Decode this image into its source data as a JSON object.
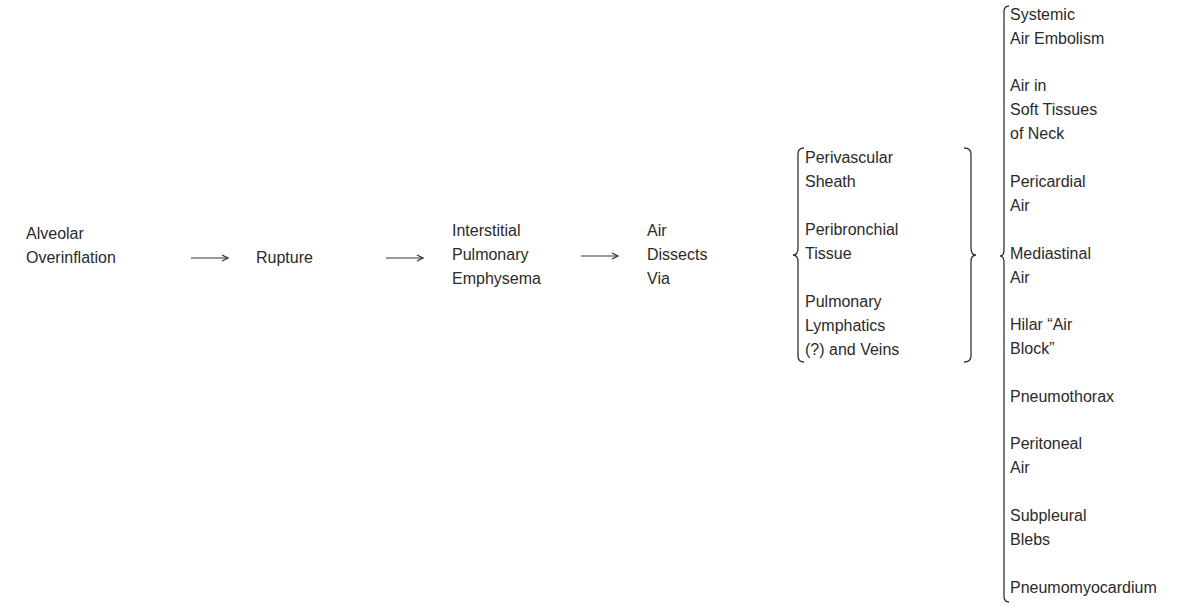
{
  "flow": [
    {
      "id": "alveolar-overinflation",
      "lines": [
        "Alveolar",
        "Overinflation"
      ]
    },
    {
      "id": "rupture",
      "lines": [
        "Rupture"
      ]
    },
    {
      "id": "interstitial-pulmonary-emphysema",
      "lines": [
        "Interstitial",
        "Pulmonary",
        "Emphysema"
      ]
    },
    {
      "id": "air-dissects-via",
      "lines": [
        "Air",
        "Dissects",
        "Via"
      ]
    }
  ],
  "pathways": [
    {
      "lines": [
        "Perivascular",
        "Sheath"
      ]
    },
    {
      "lines": [
        "Peribronchial",
        "Tissue"
      ]
    },
    {
      "lines": [
        "Pulmonary",
        "Lymphatics",
        "(?) and Veins"
      ]
    }
  ],
  "outcomes": [
    {
      "lines": [
        "Systemic",
        "Air Embolism"
      ]
    },
    {
      "lines": [
        "Air in",
        "Soft Tissues",
        "of Neck"
      ]
    },
    {
      "lines": [
        "Pericardial",
        "Air"
      ]
    },
    {
      "lines": [
        "Mediastinal",
        "Air"
      ]
    },
    {
      "lines": [
        "Hilar “Air",
        "Block”"
      ]
    },
    {
      "lines": [
        "Pneumothorax"
      ]
    },
    {
      "lines": [
        "Peritoneal",
        "Air"
      ]
    },
    {
      "lines": [
        "Subpleural",
        "Blebs"
      ]
    },
    {
      "lines": [
        "Pneumomyocardium"
      ]
    }
  ],
  "arrows": [
    "→",
    "→",
    "→"
  ]
}
